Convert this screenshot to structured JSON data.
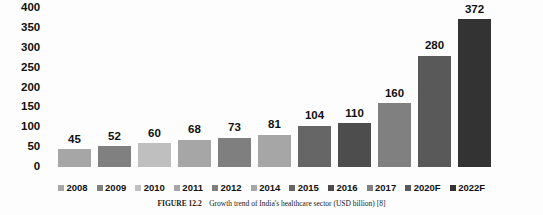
{
  "chart_data": {
    "type": "bar",
    "title": "",
    "xlabel": "",
    "ylabel": "",
    "ylim": [
      0,
      400
    ],
    "yticks": [
      400,
      350,
      300,
      250,
      200,
      150,
      100,
      50,
      0
    ],
    "grid": false,
    "legend_position": "bottom",
    "categories": [
      "2008",
      "2009",
      "2010",
      "2011",
      "2012",
      "2014",
      "2015",
      "2016",
      "2017",
      "2020F",
      "2022F"
    ],
    "values": [
      45,
      52,
      60,
      68,
      73,
      81,
      104,
      110,
      160,
      280,
      372
    ],
    "value_labels": [
      "45",
      "52",
      "60",
      "68",
      "73",
      "81",
      "104",
      "110",
      "160",
      "280",
      "372"
    ],
    "colors": [
      "#a6a6a6",
      "#808080",
      "#bfbfbf",
      "#a6a6a6",
      "#7f7f7f",
      "#a6a6a6",
      "#666666",
      "#4d4d4d",
      "#808080",
      "#595959",
      "#333333"
    ],
    "series": [
      {
        "name": "Growth trend of India's healthcare sector (USD billion)",
        "values": [
          45,
          52,
          60,
          68,
          73,
          81,
          104,
          110,
          160,
          280,
          372
        ]
      }
    ]
  },
  "legend": {
    "items": [
      {
        "label": "2008",
        "color": "#a6a6a6"
      },
      {
        "label": "2009",
        "color": "#808080"
      },
      {
        "label": "2010",
        "color": "#bfbfbf"
      },
      {
        "label": "2011",
        "color": "#a6a6a6"
      },
      {
        "label": "2012",
        "color": "#7f7f7f"
      },
      {
        "label": "2014",
        "color": "#a6a6a6"
      },
      {
        "label": "2015",
        "color": "#666666"
      },
      {
        "label": "2016",
        "color": "#4d4d4d"
      },
      {
        "label": "2017",
        "color": "#808080"
      },
      {
        "label": "2020F",
        "color": "#595959"
      },
      {
        "label": "2022F",
        "color": "#333333"
      }
    ]
  },
  "caption": {
    "label": "FIGURE 12.2",
    "text": "Growth trend of India's healthcare sector (USD billion) [8]"
  }
}
